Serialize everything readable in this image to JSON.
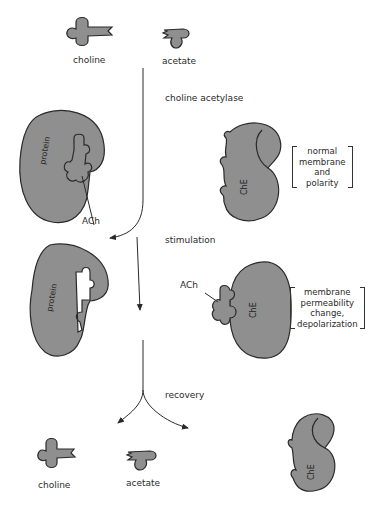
{
  "colors": {
    "molecule_fill": "#8f8f8f",
    "outline": "#2a2a2a",
    "background": "#ffffff"
  },
  "top": {
    "choline_label": "choline",
    "acetate_label": "acetate"
  },
  "steps": [
    {
      "id": "synthesis",
      "label": "choline acetylase"
    },
    {
      "id": "stimulation",
      "label": "stimulation"
    },
    {
      "id": "recovery",
      "label": "recovery"
    }
  ],
  "panel1": {
    "protein_label": "protein",
    "ach_label": "ACh",
    "enzyme_label": "ChE",
    "note_lines": [
      "normal",
      "membrane",
      "and",
      "polarity"
    ]
  },
  "panel2": {
    "protein_label": "protein",
    "ach_label": "ACh",
    "enzyme_label": "ChE",
    "note_lines": [
      "membrane",
      "permeability",
      "change,",
      "depolarization"
    ]
  },
  "bottom": {
    "choline_label": "choline",
    "acetate_label": "acetate",
    "enzyme_label": "ChE"
  }
}
